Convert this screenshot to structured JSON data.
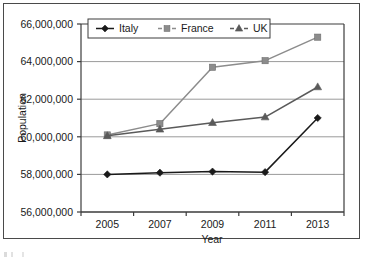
{
  "chart_data": {
    "type": "line",
    "title": "",
    "xlabel": "Year",
    "ylabel": "Population",
    "categories": [
      "2005",
      "2007",
      "2009",
      "2011",
      "2013"
    ],
    "x": [
      2005,
      2007,
      2009,
      2011,
      2013
    ],
    "ylim": [
      56000000,
      66000000
    ],
    "ytick_values": [
      66000000,
      64000000,
      62000000,
      60000000,
      58000000,
      56000000
    ],
    "ytick_labels": [
      "66,000,000",
      "64,000,000",
      "62,000,000",
      "60,000,000",
      "58,000,000",
      "56,000,000"
    ],
    "grid": true,
    "legend_position": "top-center-inside",
    "series": [
      {
        "name": "Italy",
        "marker": "diamond",
        "color": "#1a1a1a",
        "values": [
          58000000,
          58090000,
          58150000,
          58120000,
          61000000
        ]
      },
      {
        "name": "France",
        "marker": "square",
        "color": "#8c8c8c",
        "values": [
          60100000,
          60700000,
          63700000,
          64050000,
          65300000
        ]
      },
      {
        "name": "UK",
        "marker": "triangle",
        "color": "#5a5a5a",
        "values": [
          60050000,
          60400000,
          60750000,
          61050000,
          62650000
        ]
      }
    ]
  },
  "legend": {
    "items": [
      {
        "label": "Italy"
      },
      {
        "label": "France"
      },
      {
        "label": "UK"
      }
    ]
  },
  "axes": {
    "y_title": "Population",
    "x_title": "Year"
  }
}
